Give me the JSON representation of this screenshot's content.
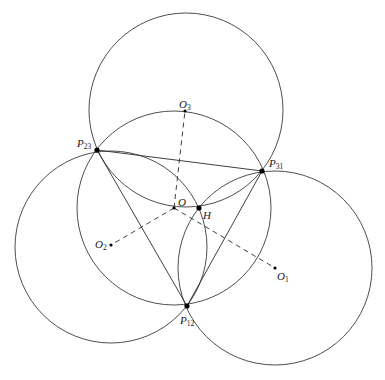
{
  "diagram": {
    "title": "",
    "circles": [
      {
        "id": "circumcircle",
        "center": "O",
        "cx": 174,
        "cy": 208,
        "r": 97
      },
      {
        "id": "circle-O1",
        "center": "O1",
        "cx": 275,
        "cy": 268,
        "r": 97
      },
      {
        "id": "circle-O2",
        "center": "O2",
        "cx": 111,
        "cy": 247,
        "r": 96
      },
      {
        "id": "circle-O3",
        "center": "O3",
        "cx": 186,
        "cy": 110,
        "r": 97
      }
    ],
    "points": {
      "P23": {
        "x": 97,
        "y": 150
      },
      "P31": {
        "x": 262,
        "y": 171
      },
      "P12": {
        "x": 187,
        "y": 306
      },
      "O": {
        "x": 174,
        "y": 208
      },
      "H": {
        "x": 199,
        "y": 208
      },
      "O1": {
        "x": 275,
        "y": 268
      },
      "O2": {
        "x": 111,
        "y": 245
      },
      "O3": {
        "x": 185,
        "y": 111
      }
    },
    "segments": [
      {
        "from": "P23",
        "to": "P31",
        "style": "solid"
      },
      {
        "from": "P23",
        "to": "P12",
        "style": "solid"
      },
      {
        "from": "P31",
        "to": "P12",
        "style": "solid"
      },
      {
        "from": "O",
        "to": "O3",
        "style": "dashed"
      },
      {
        "from": "O",
        "to": "O2",
        "style": "dashed"
      },
      {
        "from": "O",
        "to": "O1",
        "style": "dashed"
      }
    ],
    "labels": {
      "P23": {
        "base": "P",
        "sub": "23"
      },
      "P31": {
        "base": "P",
        "sub": "31"
      },
      "P12": {
        "base": "P",
        "sub": "12"
      },
      "O": {
        "base": "O",
        "sub": ""
      },
      "H": {
        "base": "H",
        "sub": ""
      },
      "O1": {
        "base": "O",
        "sub": "1"
      },
      "O2": {
        "base": "O",
        "sub": "2"
      },
      "O3": {
        "base": "O",
        "sub": "3"
      }
    },
    "colors": {
      "stroke": "#3a3a3a",
      "point": "#000000",
      "background": "#ffffff"
    }
  }
}
